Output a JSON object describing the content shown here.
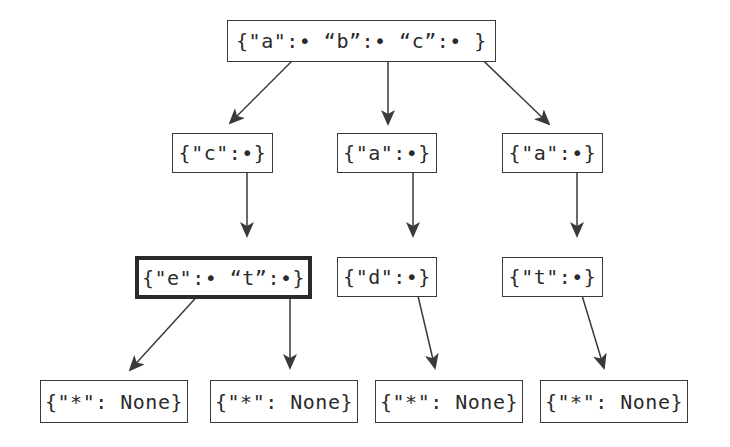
{
  "diagram": {
    "type": "trie",
    "colors": {
      "stroke": "#3a3a3a",
      "text": "#2b2b2b",
      "background": "#ffffff",
      "highlight_border": "#2a2a2a"
    },
    "nodes": [
      {
        "id": "root",
        "label": "{\"a\":• “b”:• “c”:• }",
        "highlighted": false
      },
      {
        "id": "n_a",
        "label": "{\"c\":•}",
        "highlighted": false
      },
      {
        "id": "n_b",
        "label": "{\"a\":•}",
        "highlighted": false
      },
      {
        "id": "n_c",
        "label": "{\"a\":•}",
        "highlighted": false
      },
      {
        "id": "n_ac",
        "label": "{\"e\":• “t”:•}",
        "highlighted": true
      },
      {
        "id": "n_ba",
        "label": "{\"d\":•}",
        "highlighted": false
      },
      {
        "id": "n_ca",
        "label": "{\"t\":•}",
        "highlighted": false
      },
      {
        "id": "leaf_ace",
        "label": "{\"*\": None}",
        "highlighted": false
      },
      {
        "id": "leaf_act",
        "label": "{\"*\": None}",
        "highlighted": false
      },
      {
        "id": "leaf_bad",
        "label": "{\"*\": None}",
        "highlighted": false
      },
      {
        "id": "leaf_cat",
        "label": "{\"*\": None}",
        "highlighted": false
      }
    ],
    "edges": [
      {
        "from": "root",
        "key": "a",
        "to": "n_a"
      },
      {
        "from": "root",
        "key": "b",
        "to": "n_b"
      },
      {
        "from": "root",
        "key": "c",
        "to": "n_c"
      },
      {
        "from": "n_a",
        "key": "c",
        "to": "n_ac"
      },
      {
        "from": "n_b",
        "key": "a",
        "to": "n_ba"
      },
      {
        "from": "n_c",
        "key": "a",
        "to": "n_ca"
      },
      {
        "from": "n_ac",
        "key": "e",
        "to": "leaf_ace"
      },
      {
        "from": "n_ac",
        "key": "t",
        "to": "leaf_act"
      },
      {
        "from": "n_ba",
        "key": "d",
        "to": "leaf_bad"
      },
      {
        "from": "n_ca",
        "key": "t",
        "to": "leaf_cat"
      }
    ]
  }
}
